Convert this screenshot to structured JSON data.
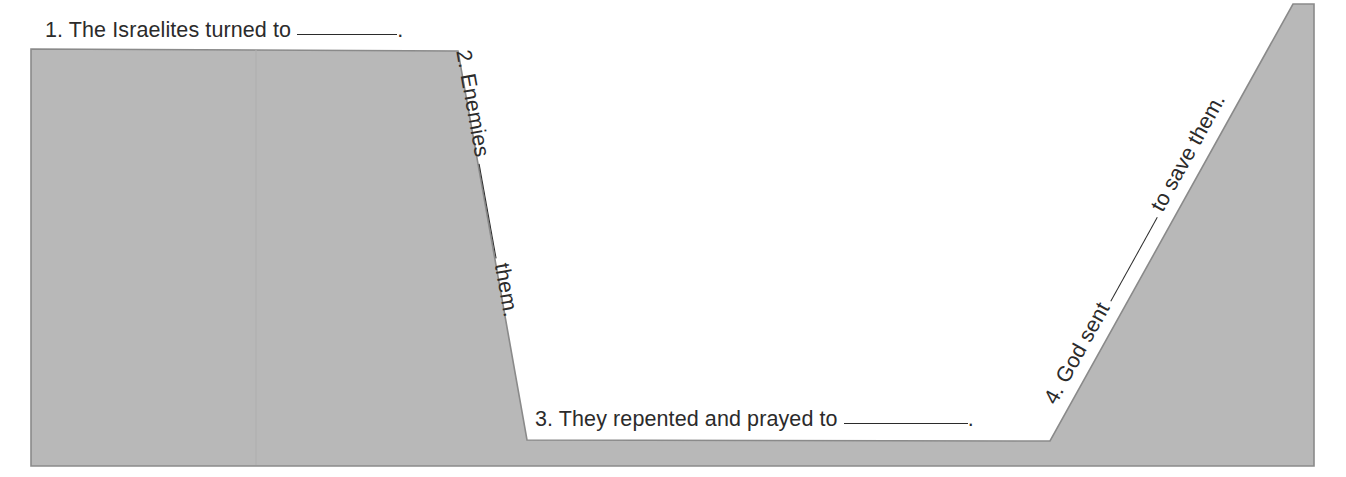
{
  "page": {
    "width": 1346,
    "height": 477,
    "background_color": "#ffffff"
  },
  "shape": {
    "name": "valley-cycle-polygon",
    "description": "Gray plateau-valley-ramp cross-section shape",
    "fill_color": "#b8b8b8",
    "stroke_color": "#8a8a8a",
    "stroke_width": 1.6,
    "points": "31,49 458,51 527,440 1050,441 1293,4 1314,4 1314,466 31,466",
    "seam_line_color": "#b0b0b0",
    "seam_line_x": 256
  },
  "steps": [
    {
      "id": 1,
      "number": "1.",
      "text_before": "The Israelites turned to",
      "blank": "__________",
      "text_after": ".",
      "full_text": "1. The Israelites turned to __________.",
      "orientation": "horizontal",
      "rotation_deg": 0,
      "position": "above-left-plateau"
    },
    {
      "id": 2,
      "number": "2.",
      "text_before": "Enemies",
      "blank": "__________",
      "text_after": "them.",
      "full_text": "2. Enemies __________ them.",
      "orientation": "rotated",
      "rotation_deg": 79.8,
      "position": "along-descending-slope"
    },
    {
      "id": 3,
      "number": "3.",
      "text_before": "They repented and prayed to",
      "blank": "______________",
      "text_after": ".",
      "full_text": "3. They repented and prayed to ______________.",
      "orientation": "horizontal",
      "rotation_deg": 0,
      "position": "on-valley-floor"
    },
    {
      "id": 4,
      "number": "4.",
      "text_before": "God sent",
      "blank": "__________",
      "text_after": "to save them.",
      "full_text": "4. God sent __________ to save them.",
      "orientation": "rotated",
      "rotation_deg": -61,
      "position": "along-ascending-slope"
    }
  ],
  "colors": {
    "text": "#2b2b2b",
    "shape_fill": "#b8b8b8",
    "shape_stroke": "#8a8a8a",
    "page_background": "#ffffff"
  }
}
